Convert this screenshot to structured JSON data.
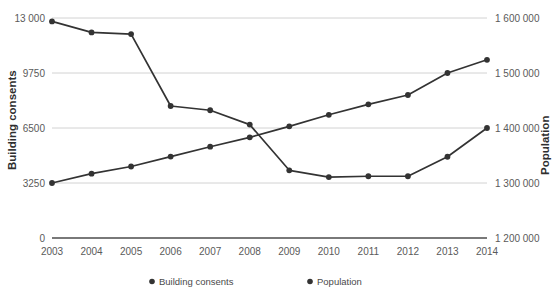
{
  "chart_data": {
    "type": "line",
    "title": "",
    "xlabel": "",
    "categories": [
      "2003",
      "2004",
      "2005",
      "2006",
      "2007",
      "2008",
      "2009",
      "2010",
      "2011",
      "2012",
      "2013",
      "2014"
    ],
    "grid": true,
    "legend_position": "bottom",
    "series": [
      {
        "name": "Building consents",
        "axis": "left",
        "color": "#333333",
        "values": [
          12800,
          12150,
          12050,
          7800,
          7550,
          6700,
          4000,
          3600,
          3650,
          3650,
          4800,
          6500
        ]
      },
      {
        "name": "Population",
        "axis": "right",
        "color": "#333333",
        "values": [
          1300000,
          1317000,
          1330000,
          1348000,
          1366000,
          1383000,
          1403000,
          1424000,
          1443000,
          1460000,
          1500000,
          1524000
        ]
      }
    ],
    "left_axis": {
      "label": "Building consents",
      "ticks": [
        "0",
        "3250",
        "6500",
        "9750",
        "13 000"
      ],
      "tick_values": [
        0,
        3250,
        6500,
        9750,
        13000
      ],
      "min": 0,
      "max": 13000
    },
    "right_axis": {
      "label": "Population",
      "ticks": [
        "1 200 000",
        "1 300 000",
        "1 400 000",
        "1 500 000",
        "1 600 000"
      ],
      "tick_values": [
        1200000,
        1300000,
        1400000,
        1500000,
        1600000
      ],
      "min": 1200000,
      "max": 1600000
    },
    "legend": [
      {
        "label": "Building consents",
        "color": "#333333"
      },
      {
        "label": "Population",
        "color": "#333333"
      }
    ]
  }
}
